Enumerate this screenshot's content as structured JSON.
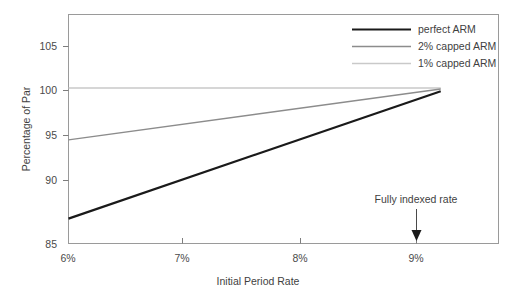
{
  "chart_data": {
    "type": "line",
    "title": "",
    "subtitle": "",
    "xlabel": "Initial Period Rate",
    "ylabel": "Percentage of Par",
    "xlim": [
      6.0,
      9.35
    ],
    "ylim": [
      85,
      107.1
    ],
    "grid": false,
    "legend_position": "top-right",
    "x_tick_labels": [
      "6%",
      "7%",
      "8%",
      "9%"
    ],
    "x_tick_values": [
      6,
      7,
      8,
      9
    ],
    "y_tick_labels": [
      "85",
      "90",
      "95",
      "100",
      "105"
    ],
    "y_tick_values": [
      85,
      90,
      95,
      100,
      105
    ],
    "series": [
      {
        "name": "perfect ARM",
        "color": "#1a1a1a",
        "width": 2.2,
        "x": [
          6.0,
          8.9
        ],
        "values": [
          87.4,
          99.7
        ]
      },
      {
        "name": "2% capped ARM",
        "color": "#8c8c8c",
        "width": 1.5,
        "x": [
          6.0,
          8.9
        ],
        "values": [
          95.0,
          99.9
        ]
      },
      {
        "name": "1% capped ARM",
        "color": "#c9c9c9",
        "width": 1.5,
        "x": [
          6.0,
          8.9
        ],
        "values": [
          100.0,
          100.0
        ]
      }
    ],
    "annotations": [
      {
        "text": "Fully indexed rate",
        "x": 9.0,
        "y_text": 92.0,
        "arrow_to_y": 85.0
      }
    ]
  },
  "axes": {
    "y_title": "Percentage of Par",
    "x_title": "Initial Period Rate",
    "y_ticks": [
      {
        "label": "105"
      },
      {
        "label": "100"
      },
      {
        "label": "95"
      },
      {
        "label": "90"
      },
      {
        "label": "85"
      }
    ],
    "x_ticks": [
      {
        "label": "6%"
      },
      {
        "label": "7%"
      },
      {
        "label": "8%"
      },
      {
        "label": "9%"
      }
    ]
  },
  "legend": {
    "entries": [
      {
        "label": "perfect ARM"
      },
      {
        "label": "2% capped ARM"
      },
      {
        "label": "1% capped ARM"
      }
    ]
  },
  "annotation": {
    "label": "Fully indexed rate"
  },
  "colors": {
    "perfect_arm": "#1a1a1a",
    "capped_2": "#8c8c8c",
    "capped_1": "#c9c9c9",
    "frame": "#9a9a9a",
    "background": "#ffffff"
  }
}
